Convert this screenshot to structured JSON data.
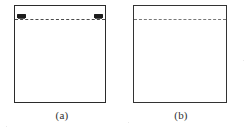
{
  "figure": {
    "background_color": "#ffffff",
    "ink_color": "#2b2b2b",
    "panels": [
      {
        "id": "a",
        "caption": "(a)",
        "frame": {
          "shape": "rectangle",
          "border_color": "#2b2b2b",
          "fill": "#ffffff"
        },
        "interface_line": {
          "style": "dashed",
          "orientation": "horizontal",
          "color": "#4a4a4a",
          "position": "near-top",
          "dash_length": "long",
          "end_markers": "two-dark-thick-marks-at-both-ends"
        }
      },
      {
        "id": "b",
        "caption": "(b)",
        "frame": {
          "shape": "rectangle",
          "border_color": "#333333",
          "fill": "#ffffff"
        },
        "interface_line": {
          "style": "dashed",
          "orientation": "horizontal",
          "color": "#6d6d6d",
          "position": "near-top",
          "dash_length": "short",
          "end_markers": "none"
        }
      }
    ]
  }
}
